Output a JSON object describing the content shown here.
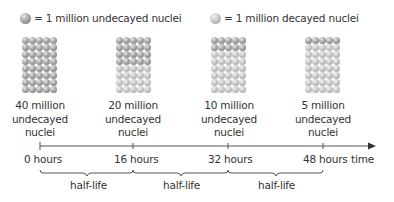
{
  "legend": {
    "undecayed": {
      "icon": "undecayed-nucleus-icon",
      "text": "= 1 million undecayed nuclei",
      "color": "#8a8a8a"
    },
    "decayed": {
      "icon": "decayed-nucleus-icon",
      "text": "= 1 million decayed nuclei",
      "color": "#bdbdbd"
    }
  },
  "stages": [
    {
      "time": "0 hours",
      "undecayed_millions": 40,
      "line1": "40 million",
      "line2": "undecayed",
      "line3": "nuclei"
    },
    {
      "time": "16 hours",
      "undecayed_millions": 20,
      "line1": "20 million",
      "line2": "undecayed",
      "line3": "nuclei"
    },
    {
      "time": "32 hours",
      "undecayed_millions": 10,
      "line1": "10 million",
      "line2": "undecayed",
      "line3": "nuclei"
    },
    {
      "time": "48 hours",
      "undecayed_millions": 5,
      "line1": "5 million",
      "line2": "undecayed",
      "line3": "nuclei"
    }
  ],
  "grid": {
    "columns": 5,
    "rows": 8,
    "total": 40
  },
  "timeline": {
    "axis_label": "time",
    "ticks": [
      "0 hours",
      "16 hours",
      "32 hours",
      "48 hours"
    ]
  },
  "half_life": {
    "label": "half-life",
    "periods": [
      "half-life",
      "half-life",
      "half-life"
    ],
    "duration_hours": 16
  }
}
